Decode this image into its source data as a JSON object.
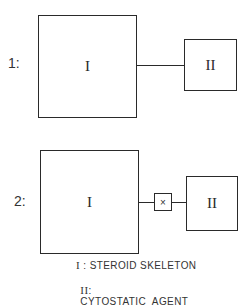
{
  "diagram": {
    "variants": [
      {
        "label": "1:",
        "large_box": "I",
        "small_box": "II",
        "linker": null
      },
      {
        "label": "2:",
        "large_box": "I",
        "small_box": "II",
        "linker": "×"
      }
    ],
    "legend": [
      {
        "symbol": "I",
        "sep": ":",
        "text": "STEROID SKELETON"
      },
      {
        "symbol": "II",
        "sep": ":",
        "text": "CYTOSTATIC  AGENT"
      }
    ]
  }
}
